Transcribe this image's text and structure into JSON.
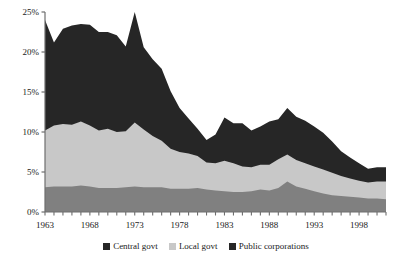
{
  "chart_data": {
    "type": "area",
    "stacked": true,
    "title": "",
    "subtitle": "",
    "xlabel": "",
    "ylabel": "",
    "ylim": [
      0,
      25
    ],
    "ytick_labels": [
      "0%",
      "5%",
      "10%",
      "15%",
      "20%",
      "25%"
    ],
    "ytick_values": [
      0,
      5,
      10,
      15,
      20,
      25
    ],
    "xlim": [
      1963,
      2001
    ],
    "xtick_labels": [
      "1963",
      "1968",
      "1973",
      "1978",
      "1983",
      "1988",
      "1993",
      "1998"
    ],
    "xtick_values": [
      1963,
      1968,
      1973,
      1978,
      1983,
      1988,
      1993,
      1998
    ],
    "x": [
      1963,
      1964,
      1965,
      1966,
      1967,
      1968,
      1969,
      1970,
      1971,
      1972,
      1973,
      1974,
      1975,
      1976,
      1977,
      1978,
      1979,
      1980,
      1981,
      1982,
      1983,
      1984,
      1985,
      1986,
      1987,
      1988,
      1989,
      1990,
      1991,
      1992,
      1993,
      1994,
      1995,
      1996,
      1997,
      1998,
      1999,
      2000,
      2001
    ],
    "grid": false,
    "legend_position": "bottom",
    "series": [
      {
        "name": "Public corporations",
        "color": "#808080",
        "stack_order": 1,
        "values": [
          3.1,
          3.2,
          3.2,
          3.2,
          3.3,
          3.2,
          3.0,
          3.0,
          3.0,
          3.1,
          3.2,
          3.1,
          3.1,
          3.1,
          2.9,
          2.9,
          2.9,
          3.0,
          2.8,
          2.7,
          2.6,
          2.5,
          2.5,
          2.6,
          2.8,
          2.7,
          3.0,
          3.8,
          3.2,
          2.9,
          2.6,
          2.3,
          2.1,
          2.0,
          1.9,
          1.8,
          1.7,
          1.7,
          1.6
        ]
      },
      {
        "name": "Local govt",
        "color": "#c8c8c8",
        "stack_order": 2,
        "values": [
          7.1,
          7.6,
          7.8,
          7.7,
          8.0,
          7.6,
          7.2,
          7.4,
          7.0,
          7.0,
          8.0,
          7.2,
          6.4,
          5.8,
          5.0,
          4.6,
          4.4,
          4.0,
          3.4,
          3.4,
          3.8,
          3.6,
          3.2,
          3.0,
          3.1,
          3.2,
          3.6,
          3.4,
          3.3,
          3.2,
          3.1,
          3.0,
          2.8,
          2.5,
          2.3,
          2.1,
          2.0,
          2.1,
          2.2
        ]
      },
      {
        "name": "Central govt",
        "color": "#262626",
        "stack_order": 3,
        "values": [
          13.8,
          10.4,
          11.9,
          12.4,
          12.2,
          12.6,
          12.3,
          12.1,
          12.1,
          10.6,
          13.8,
          10.3,
          9.6,
          9.0,
          7.2,
          5.5,
          4.4,
          3.4,
          2.8,
          3.6,
          5.4,
          5.0,
          5.4,
          4.6,
          4.8,
          5.4,
          5.0,
          5.8,
          5.4,
          5.3,
          5.0,
          4.6,
          3.9,
          3.1,
          2.6,
          2.2,
          1.7,
          1.8,
          1.8
        ]
      }
    ],
    "totals": [
      24.0,
      21.2,
      22.9,
      23.3,
      23.5,
      23.4,
      22.5,
      22.5,
      22.1,
      20.7,
      25.0,
      20.6,
      19.1,
      17.9,
      15.1,
      13.0,
      11.7,
      10.4,
      9.0,
      9.7,
      11.8,
      11.1,
      11.1,
      10.2,
      10.7,
      11.3,
      11.6,
      13.0,
      11.9,
      11.4,
      10.7,
      9.9,
      8.8,
      7.6,
      6.8,
      6.1,
      5.4,
      5.6,
      5.6
    ]
  },
  "legend": {
    "items": [
      {
        "label": "Central govt",
        "color": "#262626"
      },
      {
        "label": "Local govt",
        "color": "#c8c8c8"
      },
      {
        "label": "Public corporations",
        "color": "#262626"
      }
    ]
  },
  "axis": {
    "color": "#6e6e6e"
  }
}
